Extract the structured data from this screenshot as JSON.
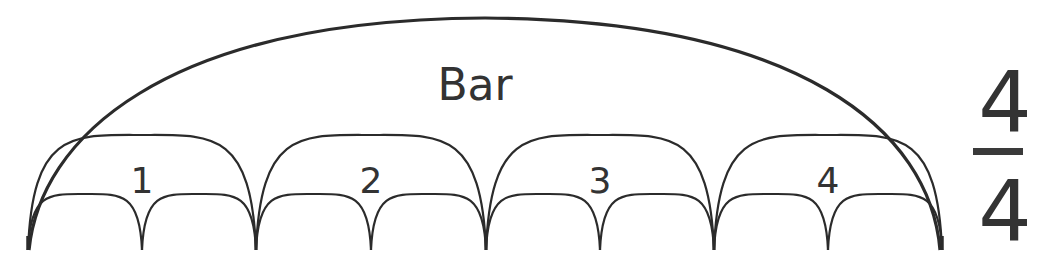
{
  "diagram": {
    "title": "Bar",
    "beats": [
      {
        "label": "1",
        "x0": 28,
        "x1": 256
      },
      {
        "label": "2",
        "x0": 256,
        "x1": 486
      },
      {
        "label": "3",
        "x0": 486,
        "x1": 714
      },
      {
        "label": "4",
        "x0": 714,
        "x1": 942
      }
    ],
    "subdivisions_per_beat": 2,
    "time_signature": {
      "numerator": "4",
      "denominator": "4"
    },
    "colors": {
      "stroke": "#2b2b2b",
      "text": "#333333",
      "background": "#ffffff"
    }
  }
}
